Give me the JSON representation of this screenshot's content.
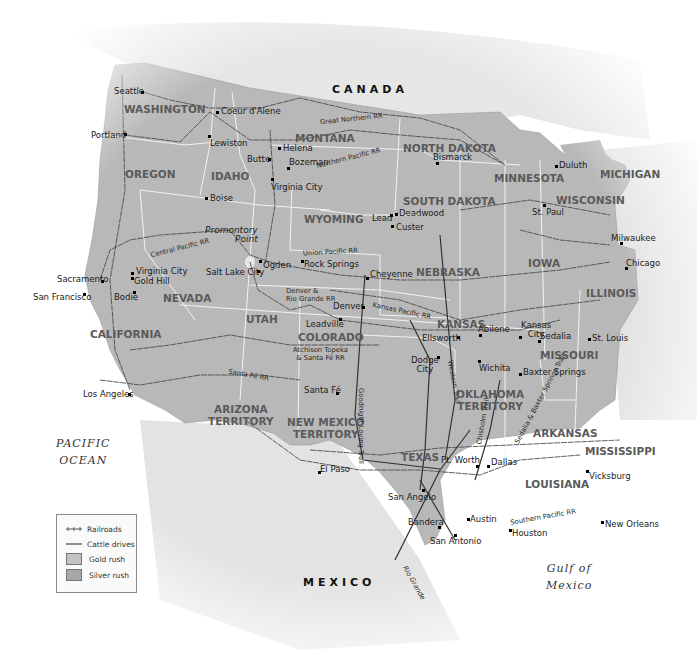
{
  "map": {
    "countries": [
      "CANADA",
      "MEXICO"
    ],
    "water_bodies": [
      {
        "name": "Pacific Ocean",
        "lines": [
          "PACIFIC",
          "OCEAN"
        ]
      },
      {
        "name": "Gulf of Mexico",
        "lines": [
          "Gulf of",
          "Mexico"
        ]
      }
    ],
    "states": {
      "washington": "WASHINGTON",
      "oregon": "OREGON",
      "idaho": "IDAHO",
      "montana": "MONTANA",
      "wyoming": "WYOMING",
      "north_dakota": "NORTH DAKOTA",
      "south_dakota": "SOUTH DAKOTA",
      "minnesota": "MINNESOTA",
      "wisconsin": "WISCONSIN",
      "michigan": "MICHIGAN",
      "nevada": "NEVADA",
      "california": "CALIFORNIA",
      "utah": "UTAH",
      "colorado": "COLORADO",
      "nebraska": "NEBRASKA",
      "iowa": "IOWA",
      "illinois": "ILLINOIS",
      "kansas": "KANSAS",
      "missouri": "MISSOURI",
      "arizona_1": "ARIZONA",
      "arizona_2": "TERRITORY",
      "new_mexico_1": "NEW MEXICO",
      "new_mexico_2": "TERRITORY",
      "oklahoma_1": "OKLAHOMA",
      "oklahoma_2": "TERRITORY",
      "arkansas": "ARKANSAS",
      "texas": "TEXAS",
      "louisiana": "LOUISIANA",
      "mississippi": "MISSISSIPPI"
    },
    "cities": {
      "seattle": "Seattle",
      "portland": "Portland",
      "coeur_dalene": "Coeur d'Alene",
      "lewiston": "Lewiston",
      "helena": "Helena",
      "butte": "Butte",
      "bozeman": "Bozeman",
      "virginia_city_mt": "Virginia City",
      "boise": "Boise",
      "bismarck": "Bismarck",
      "duluth": "Duluth",
      "st_paul": "St. Paul",
      "lead": "Lead",
      "deadwood": "Deadwood",
      "custer": "Custer",
      "milwaukee": "Milwaukee",
      "chicago": "Chicago",
      "ogden": "Ogden",
      "salt_lake_city": "Salt Lake City",
      "rock_springs": "Rock Springs",
      "cheyenne": "Cheyenne",
      "sacramento": "Sacramento",
      "virginia_city_nv": "Virginia City",
      "gold_hill": "Gold Hill",
      "san_francisco": "San Francisco",
      "bodie": "Bodie",
      "denver": "Denver",
      "leadville": "Leadville",
      "abilene": "Abilene",
      "ellsworth": "Ellsworth",
      "kansas_city_1": "Kansas",
      "kansas_city_2": "City",
      "sedalia": "Sedalia",
      "st_louis": "St. Louis",
      "dodge_city_1": "Dodge",
      "dodge_city_2": "City",
      "wichita": "Wichita",
      "baxter_springs": "Baxter Springs",
      "los_angeles": "Los Angeles",
      "santa_fe": "Santa Fé",
      "el_paso": "El Paso",
      "ft_worth": "Ft. Worth",
      "dallas": "Dallas",
      "vicksburg": "Vicksburg",
      "san_angelo": "San Angelo",
      "bandera": "Bandera",
      "austin": "Austin",
      "san_antonio": "San Antonio",
      "houston": "Houston",
      "new_orleans": "New Orleans"
    },
    "features": {
      "promontory_1": "Promontory",
      "promontory_2": "Point",
      "rio_grande": "Rio Grande"
    },
    "railroads": {
      "great_northern": "Great Northern RR",
      "northern_pacific": "Northern Pacific RR",
      "central_pacific": "Central Pacific RR",
      "union_pacific": "Union Pacific RR",
      "denver_rio_grande_1": "Denver &",
      "denver_rio_grande_2": "Rio Grande RR",
      "kansas_pacific": "Kansas Pacific RR",
      "atchison_1": "Atchison Topeka",
      "atchison_2": "& Santa Fé RR",
      "santa_fe": "Santa Fé RR",
      "southern_pacific": "Southern Pacific RR"
    },
    "cattle_trails": {
      "goodnight_loving": "Goodnight Loving Trail",
      "western": "Western Trail",
      "chisholm": "Chisholm Trail",
      "sedalia_baxter": "Sedalia & Baxter Springs Trail"
    }
  },
  "legend": {
    "items": [
      {
        "label": "Railroads",
        "symbol": "railroad-line"
      },
      {
        "label": "Cattle drives",
        "symbol": "solid-line"
      },
      {
        "label": "Gold rush",
        "symbol": "swatch",
        "color": "#c2c2c2"
      },
      {
        "label": "Silver rush",
        "symbol": "swatch",
        "color": "#a7a7a7"
      }
    ]
  },
  "colors": {
    "land_us": "#b7b7b7",
    "land_foreign": "#e4e4e4",
    "water": "#ffffff",
    "borders": "#f4f4f4",
    "railroad": "#4d4d4d",
    "cattle_trail": "#3a3a3a"
  }
}
